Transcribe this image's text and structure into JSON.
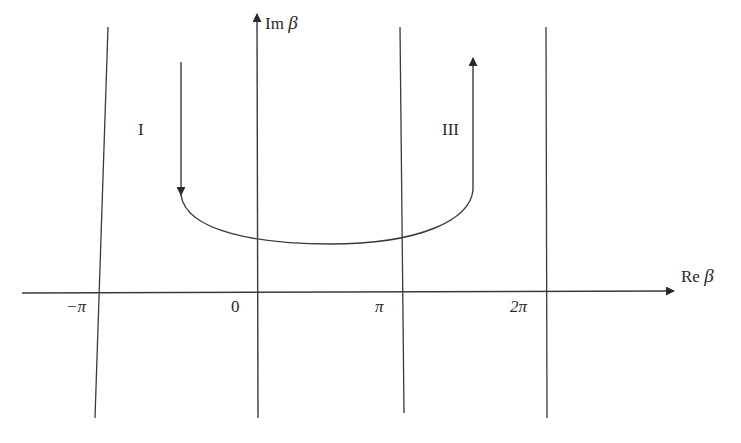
{
  "figure": {
    "axes": {
      "vertical_label_prefix": "Im",
      "vertical_label_symbol": "β",
      "horizontal_label_prefix": "Re",
      "horizontal_label_symbol": "β"
    },
    "ticks": [
      "−π",
      "0",
      "π",
      "2π"
    ],
    "regions": {
      "left": "I",
      "right": "III"
    },
    "colors": {
      "line": "#3a3a3a",
      "background": "#ffffff"
    }
  }
}
